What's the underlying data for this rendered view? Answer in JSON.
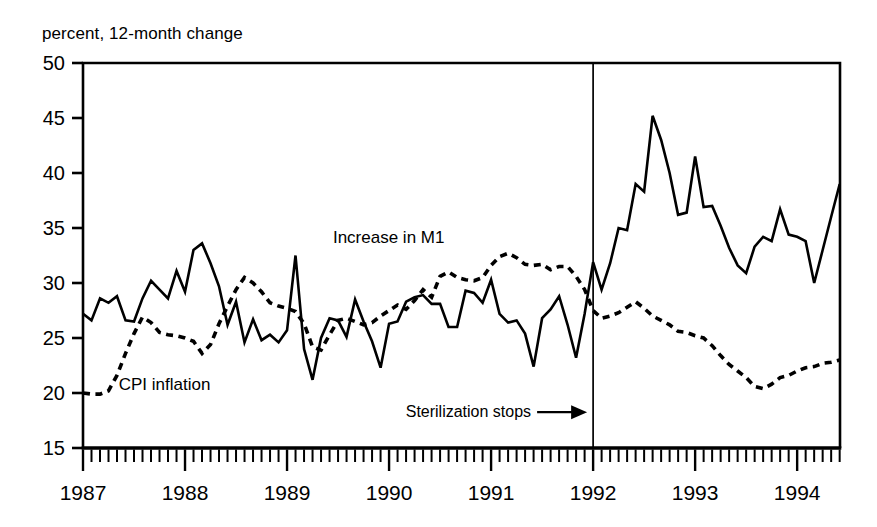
{
  "chart_data": {
    "type": "line",
    "title": "percent, 12-month change",
    "xlabel": "",
    "ylabel": "percent, 12-month change",
    "xlim": [
      1987.0,
      1994.42
    ],
    "ylim": [
      15,
      50
    ],
    "yticks": [
      15,
      20,
      25,
      30,
      35,
      40,
      45,
      50
    ],
    "xticks": [
      1987,
      1988,
      1989,
      1990,
      1991,
      1992,
      1993,
      1994
    ],
    "xtick_labels": [
      "1987",
      "1988",
      "1989",
      "1990",
      "1991",
      "1992",
      "1993",
      "1994"
    ],
    "ytick_labels": [
      "15",
      "20",
      "25",
      "30",
      "35",
      "40",
      "45",
      "50"
    ],
    "grid": false,
    "legend_position": "inline-annotation",
    "x_minor_tick_interval_months": 1,
    "annotations": [
      {
        "name": "sterilization-stops",
        "text": "Sterilization stops",
        "arrow": "→",
        "x": 1992.0,
        "y": 17.8,
        "target_x": 1992.0
      }
    ],
    "reference_lines": [
      {
        "name": "sterilization-stops-line",
        "orientation": "vertical",
        "x": 1992.0,
        "color": "#000000"
      }
    ],
    "series": [
      {
        "name": "Increase in M1",
        "style": "solid",
        "color": "#000000",
        "label_x": 1989.45,
        "label_y": 33.6,
        "x": [
          1987.0,
          1987.083,
          1987.167,
          1987.25,
          1987.333,
          1987.417,
          1987.5,
          1987.583,
          1987.667,
          1987.75,
          1987.833,
          1987.917,
          1988.0,
          1988.083,
          1988.167,
          1988.25,
          1988.333,
          1988.417,
          1988.5,
          1988.583,
          1988.667,
          1988.75,
          1988.833,
          1988.917,
          1989.0,
          1989.083,
          1989.167,
          1989.25,
          1989.333,
          1989.417,
          1989.5,
          1989.583,
          1989.667,
          1989.75,
          1989.833,
          1989.917,
          1990.0,
          1990.083,
          1990.167,
          1990.25,
          1990.333,
          1990.417,
          1990.5,
          1990.583,
          1990.667,
          1990.75,
          1990.833,
          1990.917,
          1991.0,
          1991.083,
          1991.167,
          1991.25,
          1991.333,
          1991.417,
          1991.5,
          1991.583,
          1991.667,
          1991.75,
          1991.833,
          1991.917,
          1992.0,
          1992.083,
          1992.167,
          1992.25,
          1992.333,
          1992.417,
          1992.5,
          1992.583,
          1992.667,
          1992.75,
          1992.833,
          1992.917,
          1993.0,
          1993.083,
          1993.167,
          1993.25,
          1993.333,
          1993.417,
          1993.5,
          1993.583,
          1993.667,
          1993.75,
          1993.833,
          1993.917,
          1994.0,
          1994.083,
          1994.167,
          1994.25,
          1994.333,
          1994.417
        ],
        "values": [
          27.2,
          26.6,
          28.6,
          28.2,
          28.8,
          26.6,
          26.5,
          28.6,
          30.2,
          29.4,
          28.6,
          31.1,
          29.2,
          33.0,
          33.6,
          31.8,
          29.7,
          26.2,
          28.3,
          24.6,
          26.7,
          24.8,
          25.3,
          24.6,
          25.7,
          32.5,
          24.0,
          21.2,
          25.0,
          26.8,
          26.6,
          25.1,
          28.5,
          26.5,
          24.7,
          22.3,
          26.3,
          26.5,
          28.3,
          28.7,
          28.9,
          28.1,
          28.1,
          26.0,
          26.0,
          29.3,
          29.1,
          28.2,
          30.3,
          27.2,
          26.4,
          26.6,
          25.4,
          22.4,
          26.8,
          27.6,
          28.8,
          26.2,
          23.2,
          27.2,
          31.9,
          29.4,
          31.8,
          35.0,
          34.8,
          39.0,
          38.3,
          45.2,
          43.0,
          40.0,
          36.2,
          36.4,
          41.5,
          36.9,
          37.0,
          35.2,
          33.2,
          31.6,
          30.9,
          33.3,
          34.2,
          33.8,
          36.7,
          34.4,
          34.2,
          33.8,
          30.0,
          33.0,
          36.0,
          39.0
        ]
      },
      {
        "name": "CPI inflation",
        "style": "dashed",
        "color": "#000000",
        "label_x": 1987.35,
        "label_y": 20.3,
        "x": [
          1987.0,
          1987.083,
          1987.167,
          1987.25,
          1987.333,
          1987.417,
          1987.5,
          1987.583,
          1987.667,
          1987.75,
          1987.833,
          1987.917,
          1988.0,
          1988.083,
          1988.167,
          1988.25,
          1988.333,
          1988.417,
          1988.5,
          1988.583,
          1988.667,
          1988.75,
          1988.833,
          1988.917,
          1989.0,
          1989.083,
          1989.167,
          1989.25,
          1989.333,
          1989.417,
          1989.5,
          1989.583,
          1989.667,
          1989.75,
          1989.833,
          1989.917,
          1990.0,
          1990.083,
          1990.167,
          1990.25,
          1990.333,
          1990.417,
          1990.5,
          1990.583,
          1990.667,
          1990.75,
          1990.833,
          1990.917,
          1991.0,
          1991.083,
          1991.167,
          1991.25,
          1991.333,
          1991.417,
          1991.5,
          1991.583,
          1991.667,
          1991.75,
          1991.833,
          1991.917,
          1992.0,
          1992.083,
          1992.167,
          1992.25,
          1992.333,
          1992.417,
          1992.5,
          1992.583,
          1992.667,
          1992.75,
          1992.833,
          1992.917,
          1993.0,
          1993.083,
          1993.167,
          1993.25,
          1993.333,
          1993.417,
          1993.5,
          1993.583,
          1993.667,
          1993.75,
          1993.833,
          1993.917,
          1994.0,
          1994.083,
          1994.167,
          1994.25,
          1994.333,
          1994.417
        ],
        "values": [
          20.0,
          19.9,
          19.9,
          20.2,
          21.6,
          23.6,
          25.4,
          26.9,
          26.4,
          25.5,
          25.3,
          25.2,
          25.0,
          24.7,
          23.6,
          24.4,
          26.3,
          27.9,
          29.4,
          30.5,
          30.0,
          29.2,
          28.2,
          27.9,
          27.7,
          27.4,
          26.3,
          24.2,
          23.9,
          25.3,
          26.6,
          26.8,
          26.5,
          26.2,
          26.4,
          27.0,
          27.5,
          28.0,
          27.6,
          28.4,
          29.4,
          28.7,
          30.6,
          31.0,
          30.5,
          30.3,
          30.2,
          30.5,
          31.6,
          32.4,
          32.7,
          32.3,
          31.7,
          31.6,
          31.7,
          31.2,
          31.5,
          31.5,
          30.6,
          29.4,
          27.5,
          26.8,
          27.0,
          27.3,
          27.8,
          28.3,
          27.7,
          27.0,
          26.6,
          26.2,
          25.6,
          25.5,
          25.2,
          25.0,
          24.3,
          23.4,
          22.6,
          22.0,
          21.4,
          20.6,
          20.4,
          20.8,
          21.4,
          21.6,
          22.0,
          22.3,
          22.4,
          22.7,
          22.8,
          23.0
        ]
      }
    ]
  },
  "geometry": {
    "plot_left": 83,
    "plot_right": 840,
    "plot_top": 63,
    "plot_bottom": 448
  }
}
